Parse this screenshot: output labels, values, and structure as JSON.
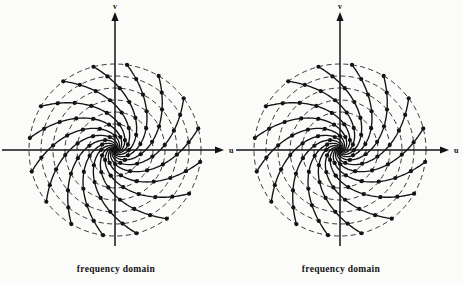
{
  "figure": {
    "background_color": "#fbfbfa",
    "ink_color": "#131313",
    "width": 462,
    "height": 283
  },
  "panels": [
    {
      "id": "left-panel",
      "caption": "frequency domain",
      "caption_x": 116,
      "caption_y": 272,
      "center": {
        "x": 115,
        "y": 150
      },
      "axes": {
        "horizontal": {
          "label": "u",
          "label_x": 229,
          "label_y": 153,
          "x1": 2,
          "x2": 224,
          "y": 150,
          "arrow": "right"
        },
        "vertical": {
          "label": "v",
          "label_x": 115,
          "label_y": 9,
          "y1": 12,
          "y2": 246,
          "x": 115,
          "arrow": "up"
        }
      }
    },
    {
      "id": "right-panel",
      "caption": "frequency domain",
      "caption_x": 341,
      "caption_y": 272,
      "center": {
        "x": 340,
        "y": 150
      },
      "axes": {
        "horizontal": {
          "label": "u",
          "label_x": 454,
          "label_y": 153,
          "x1": 236,
          "x2": 449,
          "y": 150,
          "arrow": "right"
        },
        "vertical": {
          "label": "v",
          "label_x": 340,
          "label_y": 9,
          "y1": 12,
          "y2": 246,
          "x": 340,
          "arrow": "up"
        }
      }
    }
  ],
  "chart_data": {
    "type": "scatter",
    "title": "frequency domain",
    "xlabel": "u",
    "ylabel": "v",
    "grid": true,
    "legend": "none",
    "coordinate_system": "polar",
    "ring_count": 7,
    "ring_radii": [
      14,
      26,
      38,
      50,
      62,
      74,
      86
    ],
    "spiral_arm_count": 16,
    "spiral_twist_degrees": 55,
    "spiral_start_angles_degrees": [
      0,
      22.5,
      45,
      67.5,
      90,
      112.5,
      135,
      157.5,
      180,
      202.5,
      225,
      247.5,
      270,
      292.5,
      315,
      337.5
    ],
    "sample_point_marker": "filled-circle",
    "sample_point_radius_px": 2.1,
    "rings_linestyle": "dashed",
    "rings_dasharray": "5,3.5",
    "spirals_linestyle": "solid",
    "outer_radius": 86,
    "xlim": [
      -86,
      86
    ],
    "ylim": [
      -86,
      86
    ]
  }
}
